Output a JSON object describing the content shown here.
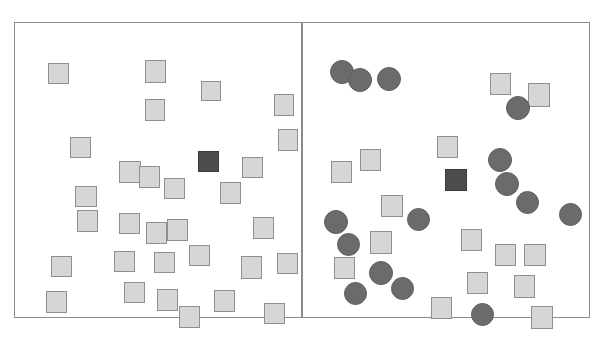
{
  "figure": {
    "width": 603,
    "height": 337,
    "background_color": "#ffffff",
    "panel_count": 2,
    "panel_border_color": "#8c8c8c",
    "divider_x": 302
  },
  "palette": {
    "distractor_square_fill": "#d6d6d6",
    "distractor_square_stroke": "#8f8f8f",
    "target_square_fill": "#4d4d4d",
    "target_square_stroke": "#3a3a3a",
    "distractor_circle_fill": "#6b6b6b",
    "distractor_circle_stroke": "#5e5e5e",
    "page_background": "#ffffff"
  },
  "panels": [
    {
      "id": "left-panel",
      "name": "feature-search-panel",
      "role": "Feature search: single dark square target among light square distractors",
      "x": 14,
      "y": 22,
      "width": 288,
      "height": 296,
      "counts": {
        "light_squares": 33,
        "dark_squares": 1,
        "dark_circles": 0,
        "total_items": 34
      },
      "shapes": [
        {
          "type": "square",
          "variant": "distractor",
          "x": 33,
          "y": 40,
          "w": 21,
          "h": 21
        },
        {
          "type": "square",
          "variant": "distractor",
          "x": 130,
          "y": 37,
          "w": 21,
          "h": 23
        },
        {
          "type": "square",
          "variant": "distractor",
          "x": 186,
          "y": 58,
          "w": 20,
          "h": 20
        },
        {
          "type": "square",
          "variant": "distractor",
          "x": 130,
          "y": 76,
          "w": 20,
          "h": 22
        },
        {
          "type": "square",
          "variant": "distractor",
          "x": 259,
          "y": 71,
          "w": 20,
          "h": 22
        },
        {
          "type": "square",
          "variant": "distractor",
          "x": 55,
          "y": 114,
          "w": 21,
          "h": 21
        },
        {
          "type": "square",
          "variant": "distractor",
          "x": 263,
          "y": 106,
          "w": 20,
          "h": 22
        },
        {
          "type": "square",
          "variant": "distractor",
          "x": 104,
          "y": 138,
          "w": 22,
          "h": 22
        },
        {
          "type": "square",
          "variant": "distractor",
          "x": 124,
          "y": 143,
          "w": 21,
          "h": 22
        },
        {
          "type": "square",
          "variant": "target",
          "x": 183,
          "y": 128,
          "w": 21,
          "h": 21
        },
        {
          "type": "square",
          "variant": "distractor",
          "x": 227,
          "y": 134,
          "w": 21,
          "h": 21
        },
        {
          "type": "square",
          "variant": "distractor",
          "x": 149,
          "y": 155,
          "w": 21,
          "h": 21
        },
        {
          "type": "square",
          "variant": "distractor",
          "x": 205,
          "y": 159,
          "w": 21,
          "h": 22
        },
        {
          "type": "square",
          "variant": "distractor",
          "x": 60,
          "y": 163,
          "w": 22,
          "h": 21
        },
        {
          "type": "square",
          "variant": "distractor",
          "x": 62,
          "y": 187,
          "w": 21,
          "h": 22
        },
        {
          "type": "square",
          "variant": "distractor",
          "x": 104,
          "y": 190,
          "w": 21,
          "h": 21
        },
        {
          "type": "square",
          "variant": "distractor",
          "x": 131,
          "y": 199,
          "w": 21,
          "h": 22
        },
        {
          "type": "square",
          "variant": "distractor",
          "x": 152,
          "y": 196,
          "w": 21,
          "h": 22
        },
        {
          "type": "square",
          "variant": "distractor",
          "x": 238,
          "y": 194,
          "w": 21,
          "h": 22
        },
        {
          "type": "square",
          "variant": "distractor",
          "x": 99,
          "y": 228,
          "w": 21,
          "h": 21
        },
        {
          "type": "square",
          "variant": "distractor",
          "x": 139,
          "y": 229,
          "w": 21,
          "h": 21
        },
        {
          "type": "square",
          "variant": "distractor",
          "x": 174,
          "y": 222,
          "w": 21,
          "h": 21
        },
        {
          "type": "square",
          "variant": "distractor",
          "x": 226,
          "y": 233,
          "w": 21,
          "h": 23
        },
        {
          "type": "square",
          "variant": "distractor",
          "x": 262,
          "y": 230,
          "w": 21,
          "h": 21
        },
        {
          "type": "square",
          "variant": "distractor",
          "x": 36,
          "y": 233,
          "w": 21,
          "h": 21
        },
        {
          "type": "square",
          "variant": "distractor",
          "x": 31,
          "y": 268,
          "w": 21,
          "h": 22
        },
        {
          "type": "square",
          "variant": "distractor",
          "x": 109,
          "y": 259,
          "w": 21,
          "h": 21
        },
        {
          "type": "square",
          "variant": "distractor",
          "x": 142,
          "y": 266,
          "w": 21,
          "h": 22
        },
        {
          "type": "square",
          "variant": "distractor",
          "x": 164,
          "y": 283,
          "w": 21,
          "h": 22
        },
        {
          "type": "square",
          "variant": "distractor",
          "x": 199,
          "y": 267,
          "w": 21,
          "h": 22
        },
        {
          "type": "square",
          "variant": "distractor",
          "x": 249,
          "y": 280,
          "w": 21,
          "h": 21
        },
        {
          "type": "square",
          "variant": "distractor",
          "x": 254,
          "y": 106,
          "w": 1,
          "h": 1
        },
        {
          "type": "square",
          "variant": "distractor",
          "x": 89,
          "y": 276,
          "w": 1,
          "h": 1
        },
        {
          "type": "square",
          "variant": "distractor",
          "x": 285,
          "y": 214,
          "w": 1,
          "h": 1
        }
      ]
    },
    {
      "id": "right-panel",
      "name": "conjunction-search-panel",
      "role": "Conjunction search: dark square target among light squares and dark circles",
      "x": 302,
      "y": 22,
      "width": 288,
      "height": 296,
      "counts": {
        "light_squares": 21,
        "dark_squares": 1,
        "dark_circles": 19,
        "total_items": 41
      },
      "shapes": [
        {
          "type": "circle",
          "variant": "distractor",
          "x": 27,
          "y": 37,
          "w": 24,
          "h": 24
        },
        {
          "type": "circle",
          "variant": "distractor",
          "x": 45,
          "y": 45,
          "w": 24,
          "h": 24
        },
        {
          "type": "circle",
          "variant": "distractor",
          "x": 74,
          "y": 44,
          "w": 24,
          "h": 24
        },
        {
          "type": "square",
          "variant": "distractor",
          "x": 187,
          "y": 50,
          "w": 21,
          "h": 22
        },
        {
          "type": "square",
          "variant": "distractor",
          "x": 225,
          "y": 60,
          "w": 22,
          "h": 24
        },
        {
          "type": "circle",
          "variant": "distractor",
          "x": 203,
          "y": 73,
          "w": 24,
          "h": 24
        },
        {
          "type": "square",
          "variant": "distractor",
          "x": 134,
          "y": 113,
          "w": 21,
          "h": 22
        },
        {
          "type": "square",
          "variant": "distractor",
          "x": 57,
          "y": 126,
          "w": 21,
          "h": 22
        },
        {
          "type": "square",
          "variant": "distractor",
          "x": 28,
          "y": 138,
          "w": 21,
          "h": 22
        },
        {
          "type": "circle",
          "variant": "distractor",
          "x": 185,
          "y": 125,
          "w": 24,
          "h": 24
        },
        {
          "type": "square",
          "variant": "target",
          "x": 142,
          "y": 146,
          "w": 22,
          "h": 22
        },
        {
          "type": "circle",
          "variant": "distractor",
          "x": 192,
          "y": 149,
          "w": 24,
          "h": 24
        },
        {
          "type": "circle",
          "variant": "distractor",
          "x": 213,
          "y": 168,
          "w": 23,
          "h": 23
        },
        {
          "type": "square",
          "variant": "distractor",
          "x": 78,
          "y": 172,
          "w": 22,
          "h": 22
        },
        {
          "type": "circle",
          "variant": "distractor",
          "x": 104,
          "y": 185,
          "w": 23,
          "h": 23
        },
        {
          "type": "circle",
          "variant": "distractor",
          "x": 21,
          "y": 187,
          "w": 24,
          "h": 24
        },
        {
          "type": "circle",
          "variant": "distractor",
          "x": 256,
          "y": 180,
          "w": 23,
          "h": 23
        },
        {
          "type": "circle",
          "variant": "distractor",
          "x": 34,
          "y": 210,
          "w": 23,
          "h": 23
        },
        {
          "type": "square",
          "variant": "distractor",
          "x": 67,
          "y": 208,
          "w": 22,
          "h": 23
        },
        {
          "type": "square",
          "variant": "distractor",
          "x": 158,
          "y": 206,
          "w": 21,
          "h": 22
        },
        {
          "type": "square",
          "variant": "distractor",
          "x": 192,
          "y": 221,
          "w": 21,
          "h": 22
        },
        {
          "type": "square",
          "variant": "distractor",
          "x": 221,
          "y": 221,
          "w": 22,
          "h": 22
        },
        {
          "type": "square",
          "variant": "distractor",
          "x": 31,
          "y": 234,
          "w": 21,
          "h": 22
        },
        {
          "type": "circle",
          "variant": "distractor",
          "x": 66,
          "y": 238,
          "w": 24,
          "h": 24
        },
        {
          "type": "circle",
          "variant": "distractor",
          "x": 88,
          "y": 254,
          "w": 23,
          "h": 23
        },
        {
          "type": "circle",
          "variant": "distractor",
          "x": 41,
          "y": 259,
          "w": 23,
          "h": 23
        },
        {
          "type": "square",
          "variant": "distractor",
          "x": 164,
          "y": 249,
          "w": 21,
          "h": 22
        },
        {
          "type": "square",
          "variant": "distractor",
          "x": 211,
          "y": 252,
          "w": 21,
          "h": 23
        },
        {
          "type": "square",
          "variant": "distractor",
          "x": 128,
          "y": 274,
          "w": 21,
          "h": 22
        },
        {
          "type": "circle",
          "variant": "distractor",
          "x": 168,
          "y": 280,
          "w": 23,
          "h": 23
        },
        {
          "type": "square",
          "variant": "distractor",
          "x": 228,
          "y": 283,
          "w": 22,
          "h": 23
        }
      ]
    }
  ]
}
